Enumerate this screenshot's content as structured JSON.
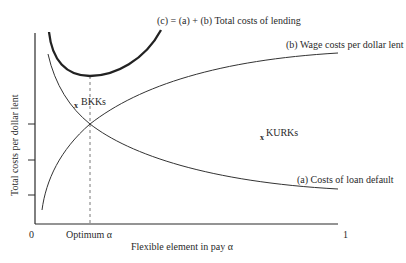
{
  "diagram": {
    "title": "(c) = (a) + (b) Total costs of lending",
    "y_axis_label": "Total costs per dollar lent",
    "x_axis_label": "Flexible element in pay α",
    "x_tick_labels": {
      "origin": "0",
      "optimum": "Optimum α",
      "end": "1"
    },
    "curves": [
      {
        "id": "c",
        "label": "(c) = (a) + (b) Total costs of lending",
        "style": "thick",
        "shape": "U-shaped"
      },
      {
        "id": "b",
        "label": "(b) Wage costs per dollar lent",
        "style": "thin",
        "shape": "increasing-concave"
      },
      {
        "id": "a",
        "label": "(a) Costs of loan default",
        "style": "thin",
        "shape": "decreasing-convex"
      }
    ],
    "points": [
      {
        "marker": "x",
        "label": "BKKs"
      },
      {
        "marker": "x",
        "label": "KURKs"
      }
    ],
    "optimum_line": "dashed vertical at intersection of (a) and (b), minimum of (c)",
    "colors": {
      "line": "#2a2a2a",
      "background": "#ffffff"
    }
  }
}
